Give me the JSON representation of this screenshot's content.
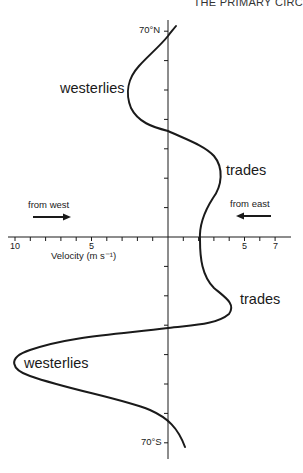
{
  "header": {
    "running_title": "THE PRIMARY CIRC"
  },
  "diagram": {
    "x_axis": {
      "label": "Velocity (m s⁻¹)",
      "tick_labels": [
        {
          "value": -10,
          "text": "10"
        },
        {
          "value": -5,
          "text": "5"
        },
        {
          "value": 5,
          "text": "5"
        },
        {
          "value": 7,
          "text": "7"
        }
      ],
      "range": [
        -10.5,
        8
      ]
    },
    "y_axis": {
      "top_label": "70°N",
      "bottom_label": "70°S",
      "tick_interval_deg": 10,
      "range": [
        70,
        -70
      ]
    },
    "annotations": {
      "west_label": "from west",
      "east_label": "from east",
      "westerlies_north": "westerlies",
      "trades_north": "trades",
      "trades_south": "trades",
      "westerlies_south": "westerlies"
    },
    "colors": {
      "line": "#1a1a1a",
      "background": "#ffffff"
    }
  },
  "chart_data": {
    "type": "line",
    "title": "",
    "xlabel": "Velocity (m s⁻¹)",
    "ylabel": "Latitude",
    "note": "Negative velocity = from west (westerlies); positive = from east (trades)",
    "series": [
      {
        "name": "zonal wind",
        "points": [
          {
            "lat": 72,
            "v": 0.5
          },
          {
            "lat": 70,
            "v": 0
          },
          {
            "lat": 60,
            "v": -1.8
          },
          {
            "lat": 52,
            "v": -2.7
          },
          {
            "lat": 45,
            "v": -2.3
          },
          {
            "lat": 35,
            "v": 0
          },
          {
            "lat": 28,
            "v": 2.4
          },
          {
            "lat": 20,
            "v": 3.4
          },
          {
            "lat": 10,
            "v": 2.4
          },
          {
            "lat": 0,
            "v": 2.1
          },
          {
            "lat": -10,
            "v": 2.4
          },
          {
            "lat": -20,
            "v": 3.8
          },
          {
            "lat": -24,
            "v": 4.3
          },
          {
            "lat": -30,
            "v": 2.0
          },
          {
            "lat": -31,
            "v": 0
          },
          {
            "lat": -38,
            "v": -8.0
          },
          {
            "lat": -43,
            "v": -10.0
          },
          {
            "lat": -48,
            "v": -8.5
          },
          {
            "lat": -60,
            "v": -2.0
          },
          {
            "lat": -70,
            "v": 0.6
          },
          {
            "lat": -72,
            "v": 1.1
          }
        ]
      }
    ],
    "ylim": [
      -70,
      70
    ],
    "xlim": [
      -10.5,
      8
    ],
    "grid": false
  }
}
